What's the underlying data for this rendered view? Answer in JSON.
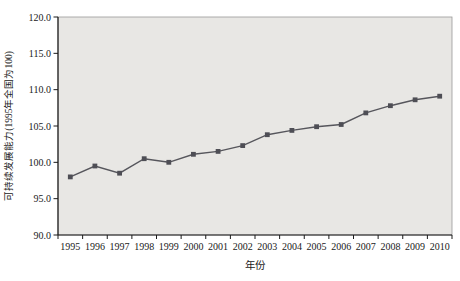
{
  "chart_data": {
    "type": "line",
    "title": "",
    "xlabel": "年份",
    "ylabel": "可持续发展能力(1995年全国为100)",
    "categories": [
      "1995",
      "1996",
      "1997",
      "1998",
      "1999",
      "2000",
      "2001",
      "2002",
      "2003",
      "2004",
      "2005",
      "2006",
      "2007",
      "2008",
      "2009",
      "2010"
    ],
    "values": [
      98.0,
      99.5,
      98.5,
      100.5,
      100.0,
      101.1,
      101.5,
      102.3,
      103.8,
      104.4,
      104.9,
      105.2,
      106.8,
      107.8,
      108.6,
      109.1
    ],
    "ylim": [
      90,
      120
    ],
    "ytick_interval": 5,
    "ytick_labels": [
      "90.0",
      "95.0",
      "100.0",
      "105.0",
      "110.0",
      "115.0",
      "120.0"
    ],
    "grid": false,
    "legend": "none",
    "marker": "square",
    "colors": {
      "line": "#56565c",
      "marker": "#4e4e55",
      "plot_background": "#e8e7e4",
      "axis": "#1a1a1a",
      "plot_border": "#9a9a98",
      "page_background": "#ffffff"
    }
  }
}
